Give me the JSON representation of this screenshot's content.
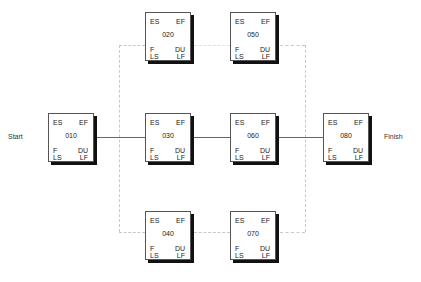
{
  "diagram": {
    "type": "network-diagram",
    "start_label": "Start",
    "finish_label": "Finish",
    "field_labels": {
      "top_left": "ES",
      "top_right": "EF",
      "bottom_left_1": "F",
      "bottom_left_2": "LS",
      "bottom_right_1": "DU",
      "bottom_right_2": "LF"
    },
    "nodes": [
      {
        "id": "010",
        "x": 48,
        "y": 113
      },
      {
        "id": "020",
        "x": 145,
        "y": 12
      },
      {
        "id": "030",
        "x": 145,
        "y": 113
      },
      {
        "id": "040",
        "x": 145,
        "y": 211
      },
      {
        "id": "050",
        "x": 230,
        "y": 12
      },
      {
        "id": "060",
        "x": 230,
        "y": 113
      },
      {
        "id": "070",
        "x": 230,
        "y": 211
      },
      {
        "id": "080",
        "x": 323,
        "y": 113
      }
    ],
    "edges": [
      {
        "from": "Start",
        "to": "010"
      },
      {
        "from": "010",
        "to": "020"
      },
      {
        "from": "010",
        "to": "030"
      },
      {
        "from": "010",
        "to": "040"
      },
      {
        "from": "020",
        "to": "050"
      },
      {
        "from": "030",
        "to": "060"
      },
      {
        "from": "040",
        "to": "070"
      },
      {
        "from": "050",
        "to": "080"
      },
      {
        "from": "060",
        "to": "080"
      },
      {
        "from": "070",
        "to": "080"
      },
      {
        "from": "080",
        "to": "Finish"
      }
    ]
  }
}
